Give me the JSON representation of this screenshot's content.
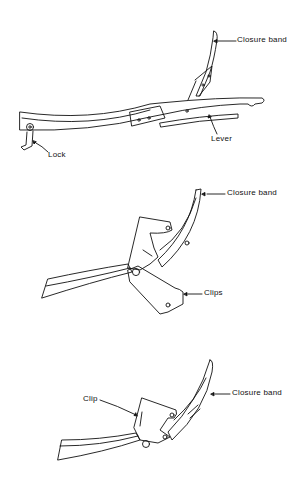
{
  "figure": {
    "panels": [
      {
        "id": "top",
        "labels": {
          "closure_band": "Closure band",
          "lever": "Lever",
          "lock": "Lock"
        }
      },
      {
        "id": "middle",
        "labels": {
          "closure_band": "Closure band",
          "clips": "Clips"
        }
      },
      {
        "id": "bottom",
        "labels": {
          "clip": "Clip",
          "closure_band": "Closure band"
        }
      }
    ],
    "colors": {
      "line": "#111111",
      "background": "#ffffff"
    }
  }
}
